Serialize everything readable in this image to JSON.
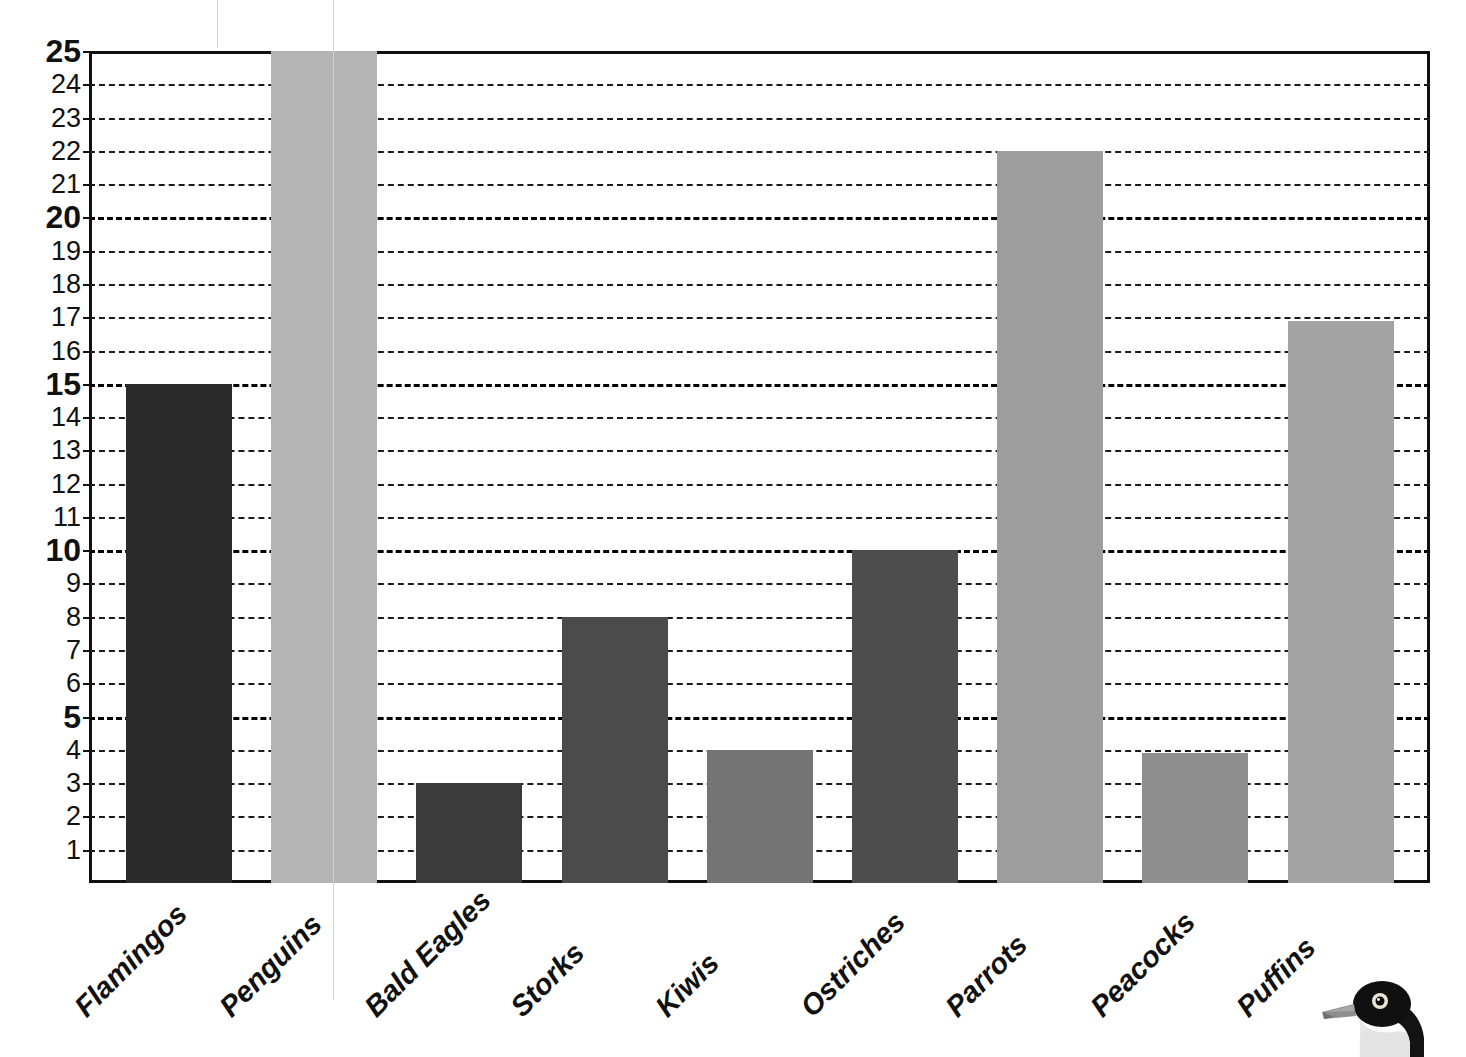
{
  "chart_data": {
    "type": "bar",
    "title": "",
    "subtitle": "",
    "xlabel": "",
    "ylabel": "",
    "categories": [
      "Flamingos",
      "Penguins",
      "Bald Eagles",
      "Storks",
      "Kiwis",
      "Ostriches",
      "Parrots",
      "Peacocks",
      "Puffins"
    ],
    "values": [
      15,
      25,
      3,
      8,
      4,
      10,
      22,
      3.9,
      16.9
    ],
    "bar_colors": [
      "#2b2b2b",
      "#b4b4b4",
      "#3b3b3b",
      "#4b4b4b",
      "#747474",
      "#4d4d4d",
      "#9d9d9d",
      "#8e8e8e",
      "#a3a3a3"
    ],
    "ylim": [
      0,
      25
    ],
    "y_tick_labels": [
      "25",
      "24",
      "23",
      "22",
      "21",
      "20",
      "19",
      "18",
      "17",
      "16",
      "15",
      "14",
      "13",
      "12",
      "11",
      "10",
      "9",
      "8",
      "7",
      "6",
      "5",
      "4",
      "3",
      "2",
      "1"
    ],
    "y_tick_values": [
      25,
      24,
      23,
      22,
      21,
      20,
      19,
      18,
      17,
      16,
      15,
      14,
      13,
      12,
      11,
      10,
      9,
      8,
      7,
      6,
      5,
      4,
      3,
      2,
      1
    ],
    "y_major_ticks": [
      25,
      20,
      15,
      10,
      5
    ],
    "grid": true,
    "grid_style": "dashed-horizontal",
    "legend": null,
    "legend_position": "none",
    "annotations": [
      {
        "name": "bird-illustration",
        "description": "puffin head photo",
        "position": "bottom-right"
      }
    ],
    "colors": {
      "axis": "#111111",
      "grid": "#1a1a1a",
      "background": "#ffffff",
      "text": "#111111"
    }
  }
}
